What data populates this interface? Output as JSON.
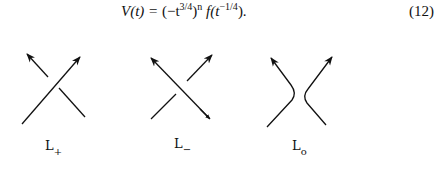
{
  "equation": {
    "lhs": "V(t) =",
    "rhs_open": "(−t",
    "rhs_exp1": "3/4",
    "rhs_mid": ")",
    "rhs_exp2": "n",
    "rhs_f": " f(t",
    "rhs_exp3": "−1/4",
    "rhs_close": ").",
    "full_text": "V(t) = (−t^{3/4})^n f(t^{−1/4}).",
    "number": "(12)"
  },
  "figures": [
    {
      "id": "L+",
      "label": "L",
      "subscript": "+"
    },
    {
      "id": "L-",
      "label": "L",
      "subscript": "−"
    },
    {
      "id": "L0",
      "label": "L",
      "subscript": "o"
    }
  ]
}
